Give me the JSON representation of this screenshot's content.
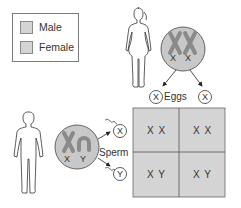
{
  "legend": {
    "items": [
      {
        "label": "Male",
        "swatch_color": "#d4d4d4"
      },
      {
        "label": "Female",
        "swatch_color": "#d4d4d4"
      }
    ]
  },
  "female": {
    "chromosomes": [
      "X",
      "X"
    ],
    "gametes_label": "Eggs",
    "gametes": [
      "X",
      "X"
    ]
  },
  "male": {
    "chromosomes": [
      "X",
      "Y"
    ],
    "gametes_label": "Sperm",
    "gametes": [
      "X",
      "Y"
    ]
  },
  "punnett": {
    "rows": [
      [
        "X X",
        "X X"
      ],
      [
        "X Y",
        "X Y"
      ]
    ]
  },
  "colors": {
    "cell_fill": "#d4d4d4",
    "nucleus_fill": "#c8c8c8",
    "chromosome_fill": "#8a8a8a",
    "line": "#444444"
  }
}
